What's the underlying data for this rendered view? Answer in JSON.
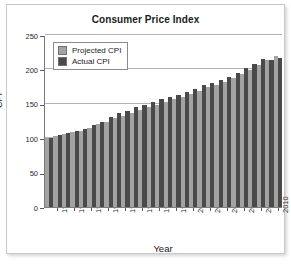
{
  "figure": {
    "background_color": "#ffffff",
    "frame_color": "#c9c9c9"
  },
  "chart_data": {
    "type": "bar",
    "title": "Consumer Price Index",
    "xlabel": "Year",
    "ylabel": "CPI",
    "ylim": [
      0,
      250
    ],
    "yticks": [
      0,
      50,
      100,
      150,
      200,
      250
    ],
    "grid": true,
    "legend_position": "upper left",
    "categories": [
      "1983",
      "1984",
      "1985",
      "1986",
      "1987",
      "1988",
      "1989",
      "1990",
      "1991",
      "1992",
      "1993",
      "1994",
      "1995",
      "1996",
      "1997",
      "1998",
      "1999",
      "2000",
      "2001",
      "2002",
      "2003",
      "2004",
      "2005",
      "2006",
      "2007",
      "2008",
      "2009",
      "2010"
    ],
    "xtick_labels": [
      "1984",
      "1986",
      "1988",
      "1990",
      "1992",
      "1994",
      "1996",
      "1998",
      "2000",
      "2002",
      "2004",
      "2006",
      "2008",
      "2010"
    ],
    "series": [
      {
        "name": "Projected CPI",
        "color": "#a3a3a3",
        "values": [
          100,
          103,
          106,
          109,
          111,
          115,
          120,
          124,
          129,
          133,
          137,
          141,
          145,
          149,
          153,
          157,
          160,
          164,
          169,
          174,
          178,
          182,
          187,
          193,
          199,
          206,
          213,
          220
        ]
      },
      {
        "name": "Actual CPI",
        "color": "#4a4a4a",
        "values": [
          100,
          104,
          108,
          110,
          114,
          119,
          124,
          131,
          136,
          140,
          145,
          149,
          152,
          157,
          160,
          163,
          167,
          172,
          177,
          180,
          184,
          189,
          195,
          202,
          208,
          215,
          214,
          217
        ]
      }
    ]
  }
}
